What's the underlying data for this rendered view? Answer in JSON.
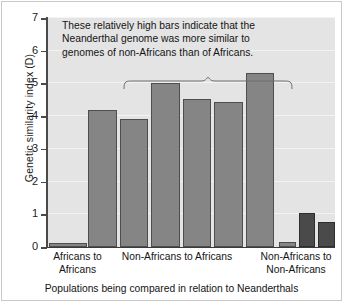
{
  "chart_data": {
    "type": "bar",
    "title": "",
    "xlabel": "Populations being compared in relation to Neanderthals",
    "ylabel": "Genetic similarity index (D)",
    "ylim": [
      0,
      7
    ],
    "yticks": [
      0,
      1,
      2,
      3,
      4,
      5,
      6,
      7
    ],
    "grid": true,
    "legend": "none",
    "groups": [
      {
        "name": "Africans to Africans",
        "label_lines": [
          "Africans to",
          "Africans"
        ],
        "values": [
          0.12
        ],
        "shade": "light"
      },
      {
        "name": "Non-Africans to Africans",
        "label_lines": [
          "Non-Africans to Africans"
        ],
        "values": [
          4.2,
          3.92,
          5.02,
          4.52,
          4.42,
          5.32
        ],
        "shade": "light"
      },
      {
        "name": "Non-Africans to Non-Africans",
        "label_lines": [
          "Non-Africans to",
          "Non-Africans"
        ],
        "values": [
          0.15,
          1.05,
          0.75
        ],
        "shades": [
          "light",
          "dark",
          "dark"
        ]
      }
    ],
    "values_flat": [
      0.12,
      4.2,
      3.92,
      5.02,
      4.52,
      4.42,
      5.32,
      0.15,
      1.05,
      0.75
    ],
    "annotations": [
      {
        "name": "high-bars-callout",
        "lines": [
          "These relatively high bars indicate that the",
          "Neanderthal genome was more similar to",
          "genomes of non-Africans than of Africans."
        ],
        "brace_spans_group": "Non-Africans to Africans"
      }
    ],
    "colors": {
      "bar_light": "#858585",
      "bar_dark": "#4a4a4a",
      "bar_edge": "#4e4e4e",
      "plot_background": "#e4e4e4",
      "gridline": "#f3f3f3",
      "axis": "#3a3a3a",
      "text": "#141414"
    }
  }
}
